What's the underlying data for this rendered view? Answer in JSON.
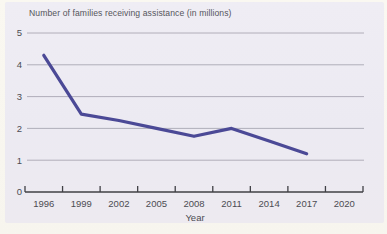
{
  "figure": {
    "title": "Number of families receiving assistance (in millions)",
    "xlabel": "Year"
  },
  "chart_data": {
    "type": "line",
    "title": "Number of families receiving assistance (in millions)",
    "xlabel": "Year",
    "ylabel": "",
    "categories": [
      "1996",
      "1999",
      "2002",
      "2005",
      "2008",
      "2011",
      "2014",
      "2017",
      "2020"
    ],
    "series": [
      {
        "name": "Families receiving assistance",
        "x": [
          "1996",
          "1999",
          "2002",
          "2005",
          "2008",
          "2011",
          "2014",
          "2017"
        ],
        "values": [
          4.3,
          2.45,
          2.25,
          2.0,
          1.75,
          2.0,
          1.6,
          1.2
        ]
      }
    ],
    "ylim": [
      0,
      5
    ],
    "yticks": [
      0,
      1,
      2,
      3,
      4,
      5
    ],
    "grid": "horizontal",
    "legend": "none"
  },
  "colors": {
    "page_bg": "#f9f7ef",
    "panel_bg": "#edebf3",
    "gridline": "#a9a7b2",
    "axis": "#404045",
    "text": "#55555b",
    "line": "#4b4996"
  }
}
